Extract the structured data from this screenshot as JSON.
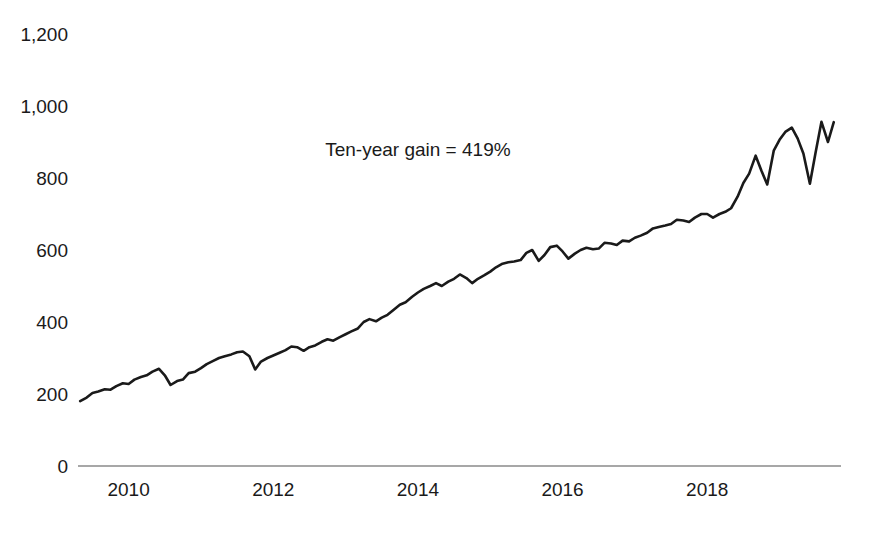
{
  "chart_data": {
    "type": "line",
    "title": "",
    "subtitle": "",
    "xlabel": "",
    "ylabel": "",
    "xlim": [
      2009.3,
      2019.85
    ],
    "ylim": [
      0,
      1260
    ],
    "grid": false,
    "legend": null,
    "line_color": "#1a1a1a",
    "axis_color": "#8a8a8a",
    "y_ticks": [
      {
        "value": 0,
        "label": "0"
      },
      {
        "value": 200,
        "label": "200"
      },
      {
        "value": 400,
        "label": "400"
      },
      {
        "value": 600,
        "label": "600"
      },
      {
        "value": 800,
        "label": "800"
      },
      {
        "value": 1000,
        "label": "1,000"
      },
      {
        "value": 1200,
        "label": "1,200"
      }
    ],
    "x_ticks": [
      {
        "value": 2010,
        "label": "2010"
      },
      {
        "value": 2012,
        "label": "2012"
      },
      {
        "value": 2014,
        "label": "2014"
      },
      {
        "value": 2016,
        "label": "2016"
      },
      {
        "value": 2018,
        "label": "2018"
      }
    ],
    "annotations": [
      {
        "text": "Ten-year gain = 419%",
        "x": 2014.0,
        "y": 880
      }
    ],
    "series": [
      {
        "name": "index",
        "x": [
          2009.33,
          2009.42,
          2009.5,
          2009.58,
          2009.67,
          2009.75,
          2009.83,
          2009.92,
          2010.0,
          2010.08,
          2010.17,
          2010.25,
          2010.33,
          2010.42,
          2010.5,
          2010.58,
          2010.67,
          2010.75,
          2010.83,
          2010.92,
          2011.0,
          2011.08,
          2011.17,
          2011.25,
          2011.33,
          2011.42,
          2011.5,
          2011.58,
          2011.67,
          2011.75,
          2011.83,
          2011.92,
          2012.0,
          2012.08,
          2012.17,
          2012.25,
          2012.33,
          2012.42,
          2012.5,
          2012.58,
          2012.67,
          2012.75,
          2012.83,
          2012.92,
          2013.0,
          2013.08,
          2013.17,
          2013.25,
          2013.33,
          2013.42,
          2013.5,
          2013.58,
          2013.67,
          2013.75,
          2013.83,
          2013.92,
          2014.0,
          2014.08,
          2014.17,
          2014.25,
          2014.33,
          2014.42,
          2014.5,
          2014.58,
          2014.67,
          2014.75,
          2014.83,
          2014.92,
          2015.0,
          2015.08,
          2015.17,
          2015.25,
          2015.33,
          2015.42,
          2015.5,
          2015.58,
          2015.67,
          2015.75,
          2015.83,
          2015.92,
          2016.0,
          2016.08,
          2016.17,
          2016.25,
          2016.33,
          2016.42,
          2016.5,
          2016.58,
          2016.67,
          2016.75,
          2016.83,
          2016.92,
          2017.0,
          2017.08,
          2017.17,
          2017.25,
          2017.33,
          2017.42,
          2017.5,
          2017.58,
          2017.67,
          2017.75,
          2017.83,
          2017.92,
          2018.0,
          2018.08,
          2018.17,
          2018.25,
          2018.33,
          2018.42,
          2018.5,
          2018.58,
          2018.67,
          2018.75,
          2018.83,
          2018.92,
          2019.0,
          2019.08,
          2019.17,
          2019.25,
          2019.33,
          2019.42,
          2019.5,
          2019.58,
          2019.67,
          2019.75
        ],
        "values": [
          180,
          190,
          203,
          207,
          213,
          212,
          222,
          230,
          228,
          240,
          247,
          252,
          262,
          270,
          252,
          225,
          236,
          240,
          258,
          262,
          272,
          283,
          292,
          300,
          305,
          310,
          316,
          318,
          305,
          268,
          290,
          300,
          307,
          314,
          322,
          332,
          330,
          320,
          330,
          335,
          345,
          352,
          348,
          358,
          366,
          374,
          382,
          400,
          408,
          402,
          412,
          420,
          435,
          448,
          455,
          470,
          482,
          492,
          500,
          508,
          500,
          512,
          520,
          532,
          522,
          508,
          520,
          530,
          540,
          552,
          562,
          566,
          568,
          572,
          592,
          600,
          570,
          586,
          608,
          612,
          596,
          576,
          590,
          600,
          606,
          602,
          604,
          620,
          618,
          614,
          626,
          624,
          634,
          640,
          648,
          660,
          664,
          668,
          672,
          684,
          682,
          678,
          690,
          700,
          700,
          690,
          700,
          706,
          716,
          748,
          786,
          812,
          862,
          820,
          782,
          876,
          906,
          928,
          940,
          910,
          868,
          784,
          872,
          956,
          900,
          955
        ]
      }
    ]
  }
}
